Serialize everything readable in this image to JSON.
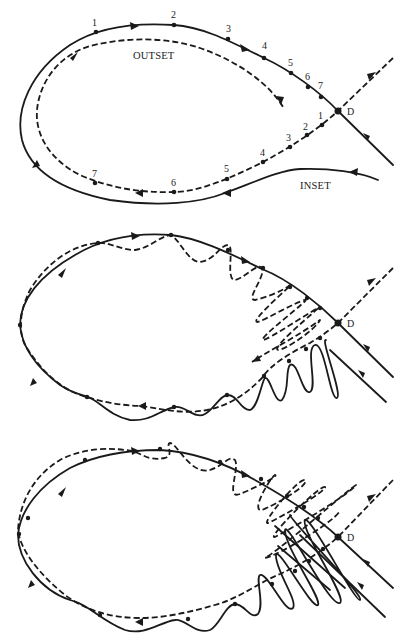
{
  "figure": {
    "colors": {
      "ink": "#1a1a1a",
      "background": "#ffffff"
    },
    "panels": [
      {
        "id": "panel-1",
        "labels": {
          "outset": "OUTSET",
          "inset": "INSET",
          "saddle": "D"
        },
        "outset_points": [
          "1",
          "2",
          "3",
          "4",
          "5",
          "6",
          "7"
        ],
        "inset_points": [
          "1",
          "2",
          "3",
          "4",
          "5",
          "6",
          "7"
        ]
      },
      {
        "id": "panel-2",
        "labels": {
          "saddle": "D"
        }
      },
      {
        "id": "panel-3",
        "labels": {
          "saddle": "D"
        }
      }
    ]
  }
}
